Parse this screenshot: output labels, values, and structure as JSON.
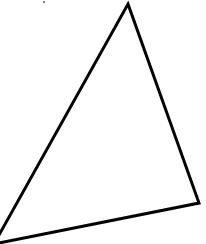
{
  "figure": {
    "shape": "triangle",
    "stroke_color": "#000000",
    "stroke_width": 3,
    "fill": "none",
    "background": "#ffffff",
    "vertices": [
      {
        "name": "top",
        "x": 128,
        "y": 4
      },
      {
        "name": "right",
        "x": 199,
        "y": 203
      },
      {
        "name": "bottom-left",
        "x": -6,
        "y": 244
      }
    ],
    "left_edge_exit": {
      "x": 0,
      "y": 229
    }
  },
  "artifacts": [
    {
      "name": "top-speck",
      "x": 43,
      "y": 1,
      "size": 2
    }
  ]
}
